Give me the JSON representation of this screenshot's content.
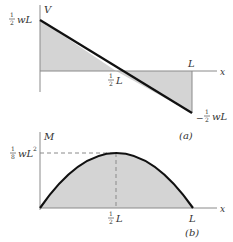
{
  "colors": {
    "fill": "#d4d4d4",
    "curve": "#111111",
    "axis": "#8a8a8a",
    "text": "#333333"
  },
  "diagram_a": {
    "caption": "(a)",
    "y_axis_label": "V",
    "x_axis_label": "x",
    "top_value_label": {
      "frac_num": "1",
      "frac_den": "2",
      "rest": "wL"
    },
    "bottom_value_label": {
      "sign": "−",
      "frac_num": "1",
      "frac_den": "2",
      "rest": "wL"
    },
    "mid_label": {
      "frac_num": "1",
      "frac_den": "2",
      "rest": "L"
    },
    "end_label": "L",
    "description": "Shear force diagram: linear from +wL/2 at x=0 to −wL/2 at x=L, zero at L/2"
  },
  "diagram_b": {
    "caption": "(b)",
    "y_axis_label": "M",
    "x_axis_label": "x",
    "max_value_label": {
      "frac_num": "1",
      "frac_den": "8",
      "rest": "wL",
      "sup": "2"
    },
    "mid_label": {
      "frac_num": "1",
      "frac_den": "2",
      "rest": "L"
    },
    "end_label": "L",
    "description": "Bending moment diagram: parabola from 0 at x=0 to max wL²/8 at x=L/2 back to 0 at x=L"
  }
}
